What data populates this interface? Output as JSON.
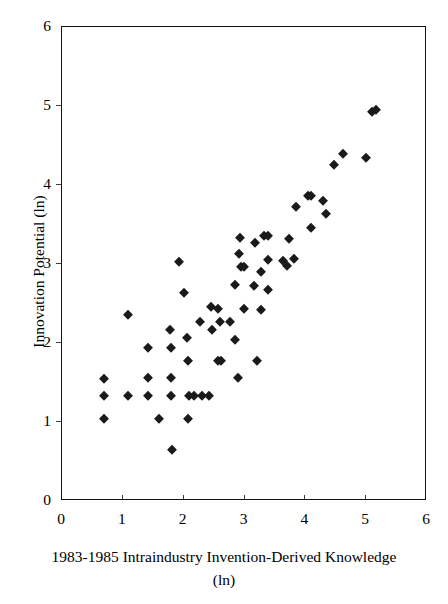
{
  "chart_data": {
    "type": "scatter",
    "title": "",
    "xlabel": "1983-1985 Intraindustry Invention-Derived Knowledge (ln)",
    "xlabel_line1": "1983-1985 Intraindustry Invention-Derived Knowledge",
    "xlabel_line2": "(ln)",
    "ylabel": "Innovation Potential (ln)",
    "xlim": [
      0,
      6
    ],
    "ylim": [
      0,
      6
    ],
    "xticks": [
      0,
      1,
      2,
      3,
      4,
      5,
      6
    ],
    "yticks": [
      0,
      1,
      2,
      3,
      4,
      5,
      6
    ],
    "xtick_labels": [
      "0",
      "1",
      "2",
      "3",
      "4",
      "5",
      "6"
    ],
    "ytick_labels": [
      "0",
      "1",
      "2",
      "3",
      "4",
      "5",
      "6"
    ],
    "grid": false,
    "legend": null,
    "marker": "diamond",
    "marker_color": "#1a1a1a",
    "marker_size": 7,
    "n_points": 76,
    "points": [
      [
        0.69,
        1.54
      ],
      [
        0.69,
        1.33
      ],
      [
        0.69,
        1.04
      ],
      [
        1.09,
        2.35
      ],
      [
        1.09,
        1.33
      ],
      [
        1.41,
        1.94
      ],
      [
        1.41,
        1.56
      ],
      [
        1.41,
        1.33
      ],
      [
        1.6,
        1.04
      ],
      [
        1.78,
        2.16
      ],
      [
        1.79,
        1.94
      ],
      [
        1.79,
        1.56
      ],
      [
        1.79,
        1.33
      ],
      [
        1.81,
        0.65
      ],
      [
        1.92,
        3.02
      ],
      [
        2.01,
        2.63
      ],
      [
        2.06,
        2.06
      ],
      [
        2.07,
        1.77
      ],
      [
        2.07,
        1.04
      ],
      [
        2.09,
        1.33
      ],
      [
        2.17,
        1.33
      ],
      [
        2.3,
        1.33
      ],
      [
        2.42,
        1.33
      ],
      [
        2.27,
        2.26
      ],
      [
        2.45,
        2.45
      ],
      [
        2.47,
        2.16
      ],
      [
        2.57,
        2.43
      ],
      [
        2.57,
        1.77
      ],
      [
        2.61,
        1.77
      ],
      [
        2.6,
        2.26
      ],
      [
        2.76,
        2.26
      ],
      [
        2.85,
        2.73
      ],
      [
        2.85,
        2.04
      ],
      [
        2.91,
        3.13
      ],
      [
        2.93,
        3.33
      ],
      [
        2.94,
        2.96
      ],
      [
        2.99,
        2.96
      ],
      [
        2.99,
        2.43
      ],
      [
        2.9,
        1.56
      ],
      [
        3.16,
        2.72
      ],
      [
        3.18,
        3.27
      ],
      [
        3.2,
        1.77
      ],
      [
        3.27,
        2.9
      ],
      [
        3.27,
        2.42
      ],
      [
        3.32,
        3.36
      ],
      [
        3.38,
        3.36
      ],
      [
        3.39,
        3.05
      ],
      [
        3.39,
        2.67
      ],
      [
        3.63,
        3.04
      ],
      [
        3.7,
        2.98
      ],
      [
        3.73,
        3.32
      ],
      [
        3.81,
        3.06
      ],
      [
        3.84,
        3.72
      ],
      [
        4.04,
        3.86
      ],
      [
        4.1,
        3.86
      ],
      [
        4.1,
        3.46
      ],
      [
        4.29,
        3.8
      ],
      [
        4.34,
        3.63
      ],
      [
        4.47,
        4.25
      ],
      [
        4.62,
        4.39
      ],
      [
        5.0,
        4.34
      ],
      [
        5.09,
        4.92
      ],
      [
        5.16,
        4.95
      ]
    ]
  },
  "axes": {
    "x_title_line1": "1983-1985 Intraindustry Invention-Derived Knowledge",
    "x_title_line2": "(ln)",
    "y_title": "Innovation Potential (ln)"
  }
}
